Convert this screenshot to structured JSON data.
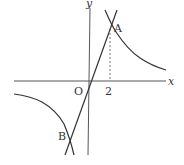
{
  "diagram": {
    "type": "coordinate-graph",
    "axes": {
      "x_label": "x",
      "y_label": "y",
      "origin_label": "O"
    },
    "ticks": {
      "x_tick": "2"
    },
    "points": {
      "A": "A",
      "B": "B"
    },
    "colors": {
      "stroke": "#333333",
      "background": "#ffffff"
    }
  }
}
